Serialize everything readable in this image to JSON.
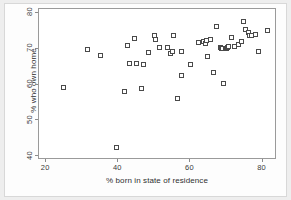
{
  "chart_data": {
    "type": "scatter",
    "title": "",
    "xlabel": "% born in state of residence",
    "ylabel": "% who own home",
    "xlim": [
      18,
      84
    ],
    "ylim": [
      39,
      81
    ],
    "xticks": [
      20,
      40,
      60,
      80
    ],
    "yticks": [
      40,
      50,
      60,
      70,
      80
    ],
    "grid": false,
    "legend": null,
    "marker": {
      "shape": "square-open",
      "edge_color": "#4a4a4a",
      "face_color": "#ffffff",
      "size_px": 5
    },
    "n_points": 51,
    "x": [
      24.8,
      31.5,
      35.1,
      39.4,
      41.7,
      42.6,
      43.0,
      44.5,
      45.1,
      46.3,
      47.0,
      48.4,
      49.9,
      50.4,
      51.4,
      53.6,
      54.5,
      55.1,
      55.4,
      56.4,
      57.4,
      57.6,
      60.1,
      62.2,
      63.6,
      64.2,
      64.5,
      64.8,
      65.6,
      66.5,
      67.2,
      68.4,
      68.6,
      69.0,
      69.3,
      69.6,
      70.1,
      70.4,
      70.6,
      71.3,
      72.3,
      73.4,
      74.2,
      74.8,
      75.3,
      76.1,
      76.4,
      77.0,
      78.1,
      79.0,
      81.3
    ],
    "y": [
      59.3,
      69.7,
      68.0,
      42.6,
      58.1,
      70.9,
      65.8,
      72.8,
      65.9,
      58.8,
      65.5,
      68.8,
      73.7,
      72.5,
      70.2,
      70.4,
      68.7,
      69.2,
      73.5,
      56.1,
      69.2,
      62.4,
      65.7,
      71.6,
      71.9,
      71.3,
      72.2,
      67.9,
      72.6,
      63.2,
      76.2,
      70.2,
      69.9,
      70.1,
      60.4,
      70.0,
      70.1,
      70.3,
      70.5,
      73.2,
      70.5,
      71.2,
      71.9,
      77.6,
      75.3,
      74.4,
      73.7,
      73.6,
      73.8,
      69.1,
      74.9
    ]
  },
  "axes": {
    "xtick_labels": [
      "20",
      "40",
      "60",
      "80"
    ],
    "ytick_labels": [
      "40",
      "50",
      "60",
      "70",
      "80"
    ],
    "xaxis_title": "% born in state of residence",
    "yaxis_title": "% who own home"
  }
}
